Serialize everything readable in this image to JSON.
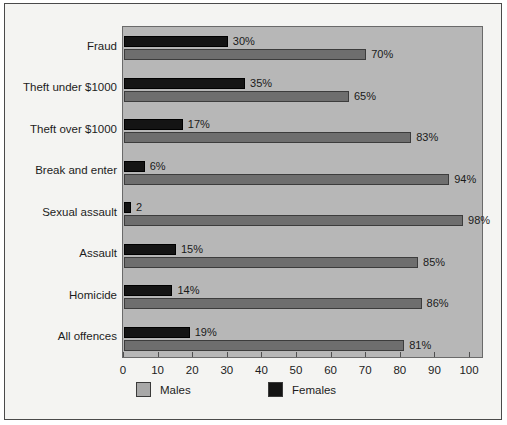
{
  "chart_data": {
    "type": "bar",
    "title": "",
    "subtitle": "",
    "xlabel": "",
    "ylabel": "",
    "orientation": "horizontal",
    "grid": false,
    "legend_position": "bottom-left",
    "xlim": [
      0,
      100
    ],
    "xticks": [
      0,
      10,
      20,
      30,
      40,
      50,
      60,
      70,
      80,
      90,
      100
    ],
    "xtick_labels": [
      "0",
      "10",
      "20",
      "30",
      "40",
      "50",
      "60",
      "70",
      "80",
      "90",
      "100"
    ],
    "categories": [
      "Fraud",
      "Theft under $1000",
      "Theft over $1000",
      "Break and enter",
      "Sexual assault",
      "Assault",
      "Homicide",
      "All offences"
    ],
    "series": [
      {
        "name": "Females",
        "color": "#141414",
        "values": [
          30,
          35,
          17,
          6,
          2,
          15,
          14,
          19
        ],
        "data_labels": [
          "30%",
          "35%",
          "17%",
          "6%",
          "2",
          "15%",
          "14%",
          "19%"
        ]
      },
      {
        "name": "Males",
        "color": "#6e6e6e",
        "values": [
          70,
          65,
          83,
          94,
          98,
          85,
          86,
          81
        ],
        "data_labels": [
          "70%",
          "65%",
          "83%",
          "94%",
          "98%",
          "85%",
          "86%",
          "81%"
        ]
      }
    ],
    "legend": [
      {
        "label": "Males",
        "color": "#a8a8a8"
      },
      {
        "label": "Females",
        "color": "#141414"
      }
    ],
    "plot_background": "#b7b7b7",
    "figure_background": "#f4f4f2"
  }
}
